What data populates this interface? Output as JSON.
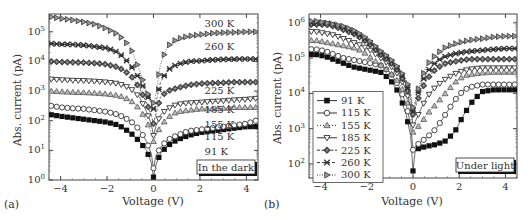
{
  "chart_data": [
    {
      "panel_label": "(a)",
      "type": "line",
      "title": "",
      "xlabel": "Voltage (V)",
      "ylabel": "Abs. current (pA)",
      "yscale": "log",
      "xlim": [
        -4.5,
        4.5
      ],
      "ylim_exp": [
        0,
        5.6
      ],
      "xticks": [
        -4,
        -2,
        0,
        2,
        4
      ],
      "xtick_labels": [
        "−4",
        "−2",
        "0",
        "2",
        "4"
      ],
      "yticks_exp": [
        0,
        1,
        2,
        3,
        4,
        5
      ],
      "annotation": "In the dark",
      "grid": false,
      "x": [
        -4.4,
        -4.0,
        -3.5,
        -3.0,
        -2.5,
        -2.0,
        -1.5,
        -1.0,
        -0.6,
        -0.3,
        -0.1,
        0.0,
        0.1,
        0.3,
        0.6,
        1.0,
        1.5,
        2.0,
        2.5,
        3.0,
        3.5,
        4.0,
        4.4
      ],
      "series": [
        {
          "name": "91 K",
          "marker": "square-filled",
          "label_pos": [
            2.2,
            0.85
          ],
          "log10_values": [
            2.2,
            2.15,
            2.1,
            2.05,
            2.0,
            1.95,
            1.85,
            1.6,
            1.3,
            1.0,
            0.6,
            0.1,
            0.5,
            0.9,
            1.15,
            1.35,
            1.5,
            1.6,
            1.65,
            1.7,
            1.75,
            1.8,
            1.8
          ]
        },
        {
          "name": "115 K",
          "marker": "circle-open",
          "label_pos": [
            2.2,
            1.35
          ],
          "log10_values": [
            2.5,
            2.45,
            2.42,
            2.4,
            2.35,
            2.3,
            2.2,
            2.0,
            1.7,
            1.3,
            0.9,
            0.4,
            0.8,
            1.1,
            1.35,
            1.5,
            1.65,
            1.7,
            1.75,
            1.8,
            1.85,
            1.9,
            2.0
          ]
        },
        {
          "name": "155 K",
          "marker": "triangle-up-gray",
          "label_pos": [
            2.2,
            1.75
          ],
          "log10_values": [
            3.0,
            2.98,
            2.96,
            2.95,
            2.93,
            2.9,
            2.85,
            2.7,
            2.4,
            2.0,
            1.6,
            1.3,
            1.5,
            1.8,
            2.1,
            2.3,
            2.35,
            2.4,
            2.4,
            2.42,
            2.45,
            2.45,
            2.45
          ]
        },
        {
          "name": "185 K",
          "marker": "triangle-down-open",
          "label_pos": [
            2.2,
            2.25
          ],
          "log10_values": [
            3.4,
            3.38,
            3.36,
            3.35,
            3.33,
            3.3,
            3.25,
            3.1,
            2.8,
            2.3,
            1.9,
            1.5,
            1.8,
            2.2,
            2.4,
            2.55,
            2.6,
            2.62,
            2.65,
            2.67,
            2.7,
            2.72,
            2.75
          ]
        },
        {
          "name": "225 K",
          "marker": "diamond-plus",
          "label_pos": [
            2.2,
            2.9
          ],
          "log10_values": [
            4.0,
            3.98,
            3.97,
            3.96,
            3.94,
            3.9,
            3.8,
            3.55,
            3.1,
            2.6,
            2.2,
            1.9,
            2.2,
            2.8,
            3.0,
            3.1,
            3.2,
            3.25,
            3.27,
            3.28,
            3.3,
            3.3,
            3.3
          ]
        },
        {
          "name": "260 K",
          "marker": "x-star",
          "label_pos": [
            2.2,
            4.4
          ],
          "log10_values": [
            4.6,
            4.58,
            4.57,
            4.55,
            4.5,
            4.45,
            4.3,
            3.9,
            3.4,
            2.9,
            2.6,
            2.4,
            2.6,
            3.3,
            3.7,
            3.9,
            4.0,
            4.02,
            4.05,
            4.07,
            4.08,
            4.08,
            4.08
          ]
        },
        {
          "name": "300 K",
          "marker": "triangle-right",
          "label_pos": [
            2.2,
            5.15
          ],
          "log10_values": [
            5.5,
            5.45,
            5.4,
            5.33,
            5.25,
            5.1,
            4.9,
            4.5,
            3.7,
            3.0,
            2.7,
            2.6,
            2.9,
            3.9,
            4.5,
            4.75,
            4.85,
            4.9,
            4.95,
            4.97,
            4.98,
            5.0,
            5.0
          ]
        }
      ]
    },
    {
      "panel_label": "(b)",
      "type": "line",
      "title": "",
      "xlabel": "Voltage (V)",
      "ylabel": "Abs. current (pA)",
      "yscale": "log",
      "xlim": [
        -4.5,
        4.5
      ],
      "ylim_exp": [
        1.6,
        6.25
      ],
      "xticks": [
        -4,
        -2,
        0,
        2,
        4
      ],
      "xtick_labels": [
        "−4",
        "−2",
        "0",
        "2",
        "4"
      ],
      "yticks_exp": [
        2,
        3,
        4,
        5,
        6
      ],
      "annotation": "Under light",
      "legend_position": "lower-left",
      "grid": false,
      "x": [
        -4.2,
        -3.8,
        -3.4,
        -3.0,
        -2.6,
        -2.2,
        -1.8,
        -1.4,
        -1.0,
        -0.6,
        -0.3,
        -0.1,
        0.0,
        0.1,
        0.3,
        0.6,
        1.0,
        1.4,
        1.8,
        2.2,
        2.6,
        3.0,
        3.5,
        4.0,
        4.4
      ],
      "series": [
        {
          "name": "91 K",
          "marker": "square-filled",
          "log10_values": [
            5.1,
            5.05,
            4.95,
            4.85,
            4.75,
            4.7,
            4.65,
            4.6,
            4.4,
            4.0,
            3.4,
            2.8,
            1.8,
            2.4,
            2.45,
            2.5,
            2.55,
            2.65,
            2.9,
            3.4,
            3.8,
            4.05,
            4.1,
            4.1,
            4.1
          ]
        },
        {
          "name": "115 K",
          "marker": "circle-open",
          "log10_values": [
            5.25,
            5.2,
            5.1,
            5.0,
            4.95,
            4.9,
            4.85,
            4.8,
            4.6,
            4.2,
            3.7,
            3.1,
            2.4,
            2.5,
            2.6,
            2.75,
            3.0,
            3.4,
            3.8,
            4.1,
            4.2,
            4.25,
            4.25,
            4.25,
            4.25
          ]
        },
        {
          "name": "155 K",
          "marker": "triangle-up-gray",
          "log10_values": [
            5.5,
            5.45,
            5.4,
            5.35,
            5.3,
            5.2,
            5.0,
            4.8,
            4.6,
            4.3,
            3.9,
            3.4,
            2.9,
            3.0,
            3.1,
            3.4,
            3.7,
            4.0,
            4.3,
            4.5,
            4.55,
            4.58,
            4.6,
            4.6,
            4.6
          ]
        },
        {
          "name": "185 K",
          "marker": "triangle-down-open",
          "log10_values": [
            5.75,
            5.7,
            5.65,
            5.55,
            5.45,
            5.35,
            5.2,
            5.0,
            4.8,
            4.5,
            4.1,
            3.6,
            3.1,
            3.2,
            3.5,
            3.9,
            4.2,
            4.4,
            4.55,
            4.65,
            4.7,
            4.72,
            4.72,
            4.72,
            4.72
          ]
        },
        {
          "name": "225 K",
          "marker": "diamond-plus",
          "log10_values": [
            5.95,
            5.95,
            5.9,
            5.8,
            5.7,
            5.55,
            5.35,
            5.1,
            4.9,
            4.6,
            4.2,
            3.8,
            3.4,
            3.6,
            4.0,
            4.4,
            4.7,
            4.85,
            4.9,
            4.95,
            4.97,
            4.97,
            4.97,
            4.97,
            4.97
          ]
        },
        {
          "name": "260 K",
          "marker": "x-star",
          "log10_values": [
            6.0,
            6.0,
            5.95,
            5.85,
            5.75,
            5.6,
            5.4,
            5.15,
            4.95,
            4.65,
            4.3,
            3.9,
            3.5,
            3.7,
            4.2,
            4.6,
            4.9,
            5.05,
            5.12,
            5.17,
            5.2,
            5.22,
            5.25,
            5.27,
            5.27
          ]
        },
        {
          "name": "300 K",
          "marker": "triangle-right",
          "log10_values": [
            6.05,
            6.0,
            5.95,
            5.9,
            5.8,
            5.65,
            5.45,
            5.2,
            5.0,
            4.7,
            4.4,
            4.0,
            3.6,
            3.8,
            4.3,
            4.8,
            5.1,
            5.3,
            5.4,
            5.47,
            5.52,
            5.55,
            5.6,
            5.62,
            5.62
          ]
        }
      ]
    }
  ],
  "panels": {
    "a": {
      "label": "(a)",
      "xlabel": "Voltage (V)",
      "ylabel": "Abs. current (pA)",
      "annotation": "In the dark"
    },
    "b": {
      "label": "(b)",
      "xlabel": "Voltage (V)",
      "ylabel": "Abs. current (pA)",
      "annotation": "Under light"
    }
  }
}
